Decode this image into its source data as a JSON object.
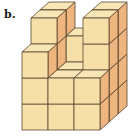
{
  "label": "b.",
  "colors": {
    "front": "#f7dfa8",
    "top": "#f9e6b6",
    "side": "#eeb57f",
    "stroke": "#5a4630"
  },
  "geometry": {
    "origin_x": 22,
    "origin_y": 130,
    "cube_w": 26,
    "cube_h": 26,
    "depth_dx": 9,
    "depth_dy": -8
  },
  "heights": [
    [
      3,
      4,
      4
    ],
    [
      2,
      2,
      3
    ],
    [
      2,
      4,
      4
    ]
  ]
}
